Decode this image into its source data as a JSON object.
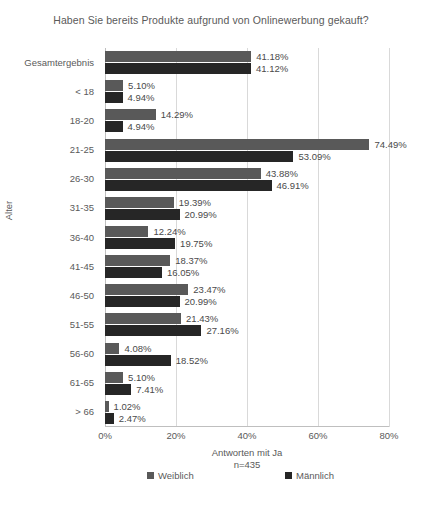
{
  "chart_data": {
    "type": "bar",
    "orientation": "horizontal",
    "title": "Haben Sie bereits Produkte aufgrund von Onlinewerbung gekauft?",
    "xlabel": "Antworten mit Ja",
    "xlabel_sub": "n=435",
    "ylabel": "Alter",
    "xlim": [
      0,
      80
    ],
    "xticks": [
      "0%",
      "20%",
      "40%",
      "60%",
      "80%"
    ],
    "xtick_values": [
      0,
      20,
      40,
      60,
      80
    ],
    "grid": true,
    "legend_position": "bottom",
    "categories": [
      "Gesamtergebnis",
      "< 18",
      "18-20",
      "21-25",
      "26-30",
      "31-35",
      "36-40",
      "41-45",
      "46-50",
      "51-55",
      "56-60",
      "61-65",
      "> 66"
    ],
    "series": [
      {
        "name": "Weiblich",
        "color": "#595959",
        "values": [
          41.18,
          5.1,
          14.29,
          74.49,
          43.88,
          19.39,
          12.24,
          18.37,
          23.47,
          21.43,
          4.08,
          5.1,
          1.02
        ],
        "labels": [
          "41.18%",
          "5.10%",
          "14.29%",
          "74.49%",
          "43.88%",
          "19.39%",
          "12.24%",
          "18.37%",
          "23.47%",
          "21.43%",
          "4.08%",
          "5.10%",
          "1.02%"
        ]
      },
      {
        "name": "Männlich",
        "color": "#262626",
        "values": [
          41.12,
          4.94,
          4.94,
          53.09,
          46.91,
          20.99,
          19.75,
          16.05,
          20.99,
          27.16,
          18.52,
          7.41,
          2.47
        ],
        "labels": [
          "41.12%",
          "4.94%",
          "4.94%",
          "53.09%",
          "46.91%",
          "20.99%",
          "19.75%",
          "16.05%",
          "20.99%",
          "27.16%",
          "18.52%",
          "7.41%",
          "2.47%"
        ]
      }
    ]
  }
}
